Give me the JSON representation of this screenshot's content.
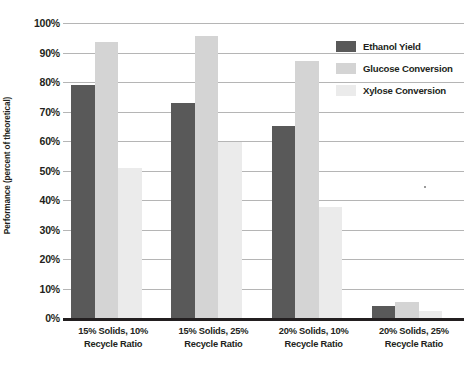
{
  "chart_data": {
    "type": "bar",
    "title": "",
    "xlabel": "",
    "ylabel": "Performance (percent of theoretical)",
    "ylim": [
      0,
      100
    ],
    "ytick_labels": [
      "100%",
      "90%",
      "80%",
      "70%",
      "60%",
      "50%",
      "40%",
      "30%",
      "20%",
      "10%",
      "0%"
    ],
    "ytick_values": [
      100,
      90,
      80,
      70,
      60,
      50,
      40,
      30,
      20,
      10,
      0
    ],
    "grid": true,
    "legend_position": "top-right",
    "categories": [
      "15% Solids, 10% Recycle Ratio",
      "15% Solids, 25% Recycle Ratio",
      "20% Solids, 10% Recycle Ratio",
      "20% Solids, 25% Recycle Ratio"
    ],
    "category_lines": [
      [
        "15% Solids, 10%",
        "Recycle Ratio"
      ],
      [
        "15% Solids, 25%",
        "Recycle Ratio"
      ],
      [
        "20% Solids, 10%",
        "Recycle Ratio"
      ],
      [
        "20% Solids, 25%",
        "Recycle Ratio"
      ]
    ],
    "series": [
      {
        "name": "Ethanol Yield",
        "color": "#595959",
        "values": [
          79,
          73,
          65,
          4
        ]
      },
      {
        "name": "Glucose Conversion",
        "color": "#d4d4d4",
        "values": [
          93.5,
          95.5,
          87,
          5.5
        ]
      },
      {
        "name": "Xylose Conversion",
        "color": "#ebebeb",
        "values": [
          51,
          59.5,
          37.5,
          2.5
        ]
      }
    ]
  },
  "axis": {
    "baseline_color": "#231f20",
    "gridline_color": "#b5b5b5"
  }
}
